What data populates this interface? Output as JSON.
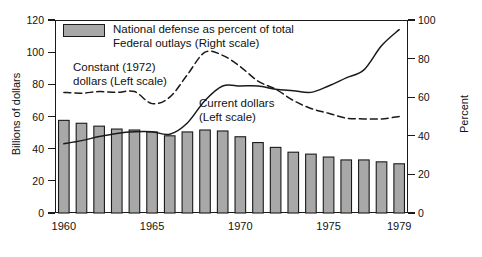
{
  "chart_data": {
    "type": "bar",
    "title": "",
    "subtitle": "",
    "xlabel": "",
    "ylabel": "Billions of dollars",
    "y2label": "Percent",
    "ylim": [
      0,
      120
    ],
    "y2lim": [
      0,
      100
    ],
    "grid": false,
    "legend_position": "top-left",
    "x": [
      1960,
      1961,
      1962,
      1963,
      1964,
      1965,
      1966,
      1967,
      1968,
      1969,
      1970,
      1971,
      1972,
      1973,
      1974,
      1975,
      1976,
      1977,
      1978,
      1979
    ],
    "categories": [
      "1960",
      "1961",
      "1962",
      "1963",
      "1964",
      "1965",
      "1966",
      "1967",
      "1968",
      "1969",
      "1970",
      "1971",
      "1972",
      "1973",
      "1974",
      "1975",
      "1976",
      "1977",
      "1978",
      "1979"
    ],
    "xticks": [
      1960,
      1965,
      1970,
      1975,
      1979
    ],
    "xtick_labels": [
      "1960",
      "1965",
      "1970",
      "1975",
      "1979"
    ],
    "yticks": [
      0,
      20,
      40,
      60,
      80,
      100,
      120
    ],
    "ytick_labels": [
      "0",
      "20",
      "40",
      "60",
      "80",
      "100",
      "120"
    ],
    "y2ticks": [
      0,
      20,
      40,
      60,
      80,
      100
    ],
    "y2tick_labels": [
      "0",
      "20",
      "40",
      "60",
      "80",
      "100"
    ],
    "series": [
      {
        "name": "National defense as percent of total Federal outlays (Right scale)",
        "type": "bar",
        "axis": "right",
        "unit": "percent",
        "color": "#a8a8a8",
        "edge_color": "#1a1a1a",
        "values": [
          48.0,
          46.5,
          45.0,
          43.5,
          43.0,
          42.0,
          40.0,
          42.0,
          43.0,
          42.5,
          39.5,
          36.5,
          34.0,
          31.5,
          30.5,
          29.0,
          27.5,
          27.5,
          26.5,
          25.5
        ]
      },
      {
        "name": "Current dollars (Left scale)",
        "type": "line",
        "axis": "left",
        "unit": "billions of dollars",
        "style": "solid",
        "color": "#1a1a1a",
        "values": [
          43.0,
          45.0,
          47.5,
          49.5,
          50.5,
          50.5,
          49.0,
          56.0,
          70.0,
          79.0,
          79.0,
          79.0,
          77.0,
          76.0,
          75.0,
          79.0,
          84.0,
          89.0,
          104.0,
          114.0
        ]
      },
      {
        "name": "Constant (1972) dollars (Left scale)",
        "type": "line",
        "axis": "left",
        "unit": "billions of dollars",
        "style": "dashed",
        "color": "#1a1a1a",
        "values": [
          75.0,
          74.5,
          75.5,
          75.0,
          75.5,
          68.0,
          72.0,
          86.0,
          100.0,
          98.0,
          91.0,
          82.0,
          77.0,
          70.0,
          65.0,
          62.0,
          59.0,
          58.5,
          58.5,
          60.0
        ]
      }
    ],
    "annotations": [
      {
        "name": "constant-dollars-label",
        "text": "Constant (1972)\ndollars (Left scale)",
        "line1": "Constant (1972)",
        "line2": "dollars (Left scale)"
      },
      {
        "name": "current-dollars-label",
        "text": "Current dollars\n(Left scale)",
        "line1": "Current dollars",
        "line2": "(Left scale)"
      }
    ],
    "legend": [
      {
        "label_line1": "National defense as percent of total",
        "label_line2": "Federal outlays (Right scale)",
        "swatch": "#a8a8a8"
      }
    ]
  },
  "axes": {
    "left_title": "Billions of dollars",
    "right_title": "Percent"
  },
  "legend": {
    "bar_line1": "National defense as percent of total",
    "bar_line2": "Federal outlays (Right scale)"
  },
  "annotations": {
    "constant_line1": "Constant (1972)",
    "constant_line2": "dollars (Left scale)",
    "current_line1": "Current dollars",
    "current_line2": "(Left scale)"
  },
  "colors": {
    "bar_fill": "#a8a8a8",
    "bar_edge": "#1a1a1a",
    "line": "#1a1a1a",
    "background": "#ffffff"
  }
}
